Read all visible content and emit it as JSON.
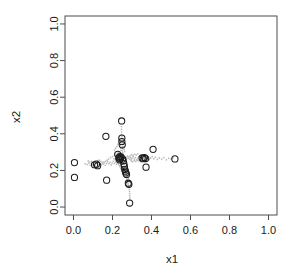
{
  "chart_data": {
    "type": "scatter",
    "title": "",
    "xlabel": "x1",
    "ylabel": "x2",
    "xlim": [
      0.0,
      1.0
    ],
    "ylim": [
      0.0,
      1.0
    ],
    "grid": false,
    "legend": null,
    "xticks": [
      "0.0",
      "0.2",
      "0.4",
      "0.6",
      "0.8",
      "1.0"
    ],
    "xtick_values": [
      0.0,
      0.2,
      0.4,
      0.6,
      0.8,
      1.0
    ],
    "yticks": [
      "0.0",
      "0.2",
      "0.4",
      "0.6",
      "0.8",
      "1.0"
    ],
    "ytick_values": [
      0.0,
      0.2,
      0.4,
      0.6,
      0.8,
      1.0
    ],
    "series": [
      {
        "name": "observations",
        "marker": "open-circle",
        "color": "#1c1c1c",
        "points": [
          [
            0.005,
            0.243
          ],
          [
            0.005,
            0.162
          ],
          [
            0.108,
            0.231
          ],
          [
            0.118,
            0.234
          ],
          [
            0.124,
            0.226
          ],
          [
            0.166,
            0.386
          ],
          [
            0.17,
            0.147
          ],
          [
            0.227,
            0.288
          ],
          [
            0.232,
            0.268
          ],
          [
            0.236,
            0.258
          ],
          [
            0.238,
            0.276
          ],
          [
            0.24,
            0.265
          ],
          [
            0.244,
            0.272
          ],
          [
            0.247,
            0.47
          ],
          [
            0.248,
            0.377
          ],
          [
            0.248,
            0.358
          ],
          [
            0.25,
            0.34
          ],
          [
            0.252,
            0.262
          ],
          [
            0.255,
            0.252
          ],
          [
            0.258,
            0.237
          ],
          [
            0.261,
            0.222
          ],
          [
            0.263,
            0.205
          ],
          [
            0.266,
            0.196
          ],
          [
            0.268,
            0.186
          ],
          [
            0.272,
            0.178
          ],
          [
            0.281,
            0.13
          ],
          [
            0.284,
            0.124
          ],
          [
            0.288,
            0.022
          ],
          [
            0.352,
            0.268
          ],
          [
            0.358,
            0.264
          ],
          [
            0.364,
            0.27
          ],
          [
            0.37,
            0.265
          ],
          [
            0.372,
            0.218
          ],
          [
            0.408,
            0.315
          ],
          [
            0.52,
            0.263
          ]
        ]
      },
      {
        "name": "noise-cloud",
        "marker": "small-dot",
        "color": "#b9b9b9",
        "points": [
          [
            0.06,
            0.236
          ],
          [
            0.07,
            0.232
          ],
          [
            0.078,
            0.24
          ],
          [
            0.085,
            0.228
          ],
          [
            0.092,
            0.238
          ],
          [
            0.098,
            0.23
          ],
          [
            0.104,
            0.242
          ],
          [
            0.11,
            0.224
          ],
          [
            0.115,
            0.236
          ],
          [
            0.122,
            0.244
          ],
          [
            0.128,
            0.228
          ],
          [
            0.134,
            0.24
          ],
          [
            0.14,
            0.232
          ],
          [
            0.146,
            0.246
          ],
          [
            0.152,
            0.234
          ],
          [
            0.158,
            0.242
          ],
          [
            0.163,
            0.228
          ],
          [
            0.169,
            0.238
          ],
          [
            0.175,
            0.248
          ],
          [
            0.181,
            0.236
          ],
          [
            0.187,
            0.244
          ],
          [
            0.193,
            0.23
          ],
          [
            0.198,
            0.24
          ],
          [
            0.204,
            0.25
          ],
          [
            0.21,
            0.238
          ],
          [
            0.216,
            0.246
          ],
          [
            0.221,
            0.234
          ],
          [
            0.227,
            0.244
          ],
          [
            0.232,
            0.252
          ],
          [
            0.238,
            0.24
          ],
          [
            0.24,
            0.262
          ],
          [
            0.244,
            0.27
          ],
          [
            0.248,
            0.258
          ],
          [
            0.252,
            0.266
          ],
          [
            0.256,
            0.276
          ],
          [
            0.26,
            0.264
          ],
          [
            0.264,
            0.272
          ],
          [
            0.268,
            0.26
          ],
          [
            0.272,
            0.268
          ],
          [
            0.276,
            0.278
          ],
          [
            0.28,
            0.266
          ],
          [
            0.284,
            0.274
          ],
          [
            0.288,
            0.262
          ],
          [
            0.292,
            0.27
          ],
          [
            0.296,
            0.258
          ],
          [
            0.3,
            0.266
          ],
          [
            0.306,
            0.274
          ],
          [
            0.312,
            0.262
          ],
          [
            0.318,
            0.27
          ],
          [
            0.324,
            0.258
          ],
          [
            0.33,
            0.266
          ],
          [
            0.336,
            0.274
          ],
          [
            0.342,
            0.262
          ],
          [
            0.348,
            0.27
          ],
          [
            0.354,
            0.26
          ],
          [
            0.36,
            0.268
          ],
          [
            0.366,
            0.258
          ],
          [
            0.372,
            0.266
          ],
          [
            0.38,
            0.272
          ],
          [
            0.388,
            0.26
          ],
          [
            0.396,
            0.268
          ],
          [
            0.404,
            0.276
          ],
          [
            0.412,
            0.264
          ],
          [
            0.42,
            0.272
          ],
          [
            0.43,
            0.26
          ],
          [
            0.44,
            0.268
          ],
          [
            0.452,
            0.262
          ],
          [
            0.464,
            0.27
          ],
          [
            0.476,
            0.258
          ],
          [
            0.488,
            0.266
          ],
          [
            0.5,
            0.262
          ],
          [
            0.51,
            0.268
          ],
          [
            0.246,
            0.44
          ],
          [
            0.246,
            0.424
          ],
          [
            0.247,
            0.41
          ],
          [
            0.247,
            0.396
          ],
          [
            0.248,
            0.384
          ],
          [
            0.248,
            0.37
          ],
          [
            0.249,
            0.356
          ],
          [
            0.249,
            0.344
          ],
          [
            0.25,
            0.332
          ],
          [
            0.25,
            0.32
          ],
          [
            0.251,
            0.308
          ],
          [
            0.252,
            0.298
          ],
          [
            0.253,
            0.29
          ],
          [
            0.254,
            0.284
          ],
          [
            0.238,
            0.352
          ],
          [
            0.24,
            0.336
          ],
          [
            0.242,
            0.322
          ],
          [
            0.244,
            0.31
          ],
          [
            0.256,
            0.346
          ],
          [
            0.258,
            0.33
          ],
          [
            0.26,
            0.316
          ],
          [
            0.262,
            0.304
          ],
          [
            0.26,
            0.222
          ],
          [
            0.262,
            0.212
          ],
          [
            0.264,
            0.202
          ],
          [
            0.266,
            0.192
          ],
          [
            0.268,
            0.182
          ],
          [
            0.27,
            0.172
          ],
          [
            0.272,
            0.162
          ],
          [
            0.274,
            0.152
          ],
          [
            0.276,
            0.142
          ],
          [
            0.278,
            0.134
          ],
          [
            0.28,
            0.126
          ],
          [
            0.282,
            0.118
          ],
          [
            0.284,
            0.108
          ],
          [
            0.286,
            0.098
          ],
          [
            0.287,
            0.086
          ],
          [
            0.288,
            0.074
          ],
          [
            0.288,
            0.062
          ],
          [
            0.289,
            0.05
          ],
          [
            0.289,
            0.038
          ],
          [
            0.27,
            0.196
          ],
          [
            0.274,
            0.184
          ],
          [
            0.278,
            0.17
          ],
          [
            0.282,
            0.156
          ],
          [
            0.286,
            0.144
          ],
          [
            0.292,
            0.132
          ],
          [
            0.296,
            0.124
          ],
          [
            0.19,
            0.27
          ],
          [
            0.2,
            0.276
          ],
          [
            0.21,
            0.282
          ],
          [
            0.218,
            0.288
          ],
          [
            0.226,
            0.294
          ],
          [
            0.232,
            0.3
          ],
          [
            0.18,
            0.262
          ],
          [
            0.172,
            0.256
          ],
          [
            0.164,
            0.25
          ],
          [
            0.156,
            0.246
          ],
          [
            0.148,
            0.24
          ],
          [
            0.14,
            0.25
          ],
          [
            0.132,
            0.256
          ],
          [
            0.124,
            0.252
          ],
          [
            0.116,
            0.244
          ],
          [
            0.108,
            0.25
          ],
          [
            0.1,
            0.244
          ],
          [
            0.092,
            0.25
          ],
          [
            0.084,
            0.246
          ],
          [
            0.076,
            0.252
          ],
          [
            0.21,
            0.31
          ],
          [
            0.216,
            0.32
          ],
          [
            0.222,
            0.33
          ],
          [
            0.228,
            0.342
          ],
          [
            0.234,
            0.356
          ],
          [
            0.236,
            0.368
          ],
          [
            0.226,
            0.244
          ],
          [
            0.23,
            0.236
          ],
          [
            0.234,
            0.228
          ],
          [
            0.238,
            0.22
          ],
          [
            0.242,
            0.212
          ],
          [
            0.246,
            0.206
          ],
          [
            0.25,
            0.2
          ],
          [
            0.254,
            0.194
          ],
          [
            0.258,
            0.188
          ],
          [
            0.22,
            0.252
          ],
          [
            0.214,
            0.258
          ],
          [
            0.208,
            0.264
          ],
          [
            0.296,
            0.252
          ],
          [
            0.304,
            0.248
          ],
          [
            0.312,
            0.254
          ],
          [
            0.32,
            0.25
          ],
          [
            0.328,
            0.256
          ],
          [
            0.336,
            0.252
          ],
          [
            0.344,
            0.248
          ],
          [
            0.352,
            0.254
          ],
          [
            0.29,
            0.28
          ],
          [
            0.298,
            0.286
          ],
          [
            0.306,
            0.282
          ],
          [
            0.314,
            0.288
          ],
          [
            0.322,
            0.284
          ],
          [
            0.33,
            0.29
          ]
        ]
      }
    ]
  },
  "axis": {
    "x_title": "x1",
    "y_title": "x2"
  }
}
